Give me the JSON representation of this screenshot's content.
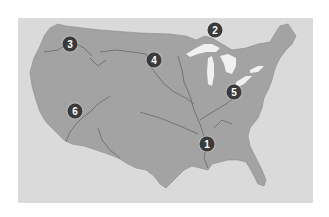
{
  "map": {
    "title": "",
    "region": "Contiguous United States",
    "colors": {
      "background": "#ffffff",
      "water": "#dadada",
      "land": "#a3a3a3",
      "rivers": "#6e6e6e",
      "lakes": "#f2f2f2",
      "marker_fill": "#3a3a3a",
      "marker_text": "#ffffff"
    },
    "markers": [
      {
        "label": "1",
        "x": 207,
        "y": 144
      },
      {
        "label": "2",
        "x": 215,
        "y": 30
      },
      {
        "label": "3",
        "x": 70,
        "y": 44
      },
      {
        "label": "4",
        "x": 154,
        "y": 60
      },
      {
        "label": "5",
        "x": 234,
        "y": 92
      },
      {
        "label": "6",
        "x": 75,
        "y": 111
      }
    ]
  }
}
